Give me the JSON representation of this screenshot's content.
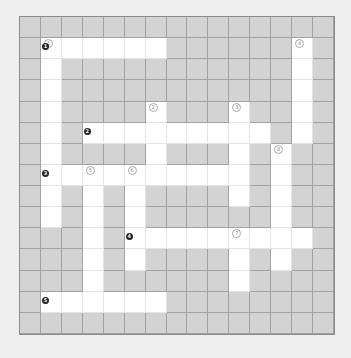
{
  "puzzle": {
    "rows": 15,
    "cols": 15,
    "colors": {
      "background": "#efefef",
      "block": "#d3d3d3",
      "open": "#ffffff",
      "grid_line": "#a2a2a2"
    },
    "white_cells": [
      [
        1,
        1
      ],
      [
        1,
        2
      ],
      [
        1,
        3
      ],
      [
        1,
        4
      ],
      [
        1,
        5
      ],
      [
        1,
        6
      ],
      [
        1,
        13
      ],
      [
        2,
        1
      ],
      [
        2,
        13
      ],
      [
        3,
        1
      ],
      [
        3,
        13
      ],
      [
        4,
        1
      ],
      [
        4,
        6
      ],
      [
        4,
        10
      ],
      [
        4,
        13
      ],
      [
        5,
        1
      ],
      [
        5,
        3
      ],
      [
        5,
        4
      ],
      [
        5,
        5
      ],
      [
        5,
        6
      ],
      [
        5,
        7
      ],
      [
        5,
        8
      ],
      [
        5,
        9
      ],
      [
        5,
        10
      ],
      [
        5,
        11
      ],
      [
        5,
        13
      ],
      [
        6,
        1
      ],
      [
        6,
        6
      ],
      [
        6,
        10
      ],
      [
        6,
        12
      ],
      [
        7,
        1
      ],
      [
        7,
        2
      ],
      [
        7,
        3
      ],
      [
        7,
        4
      ],
      [
        7,
        5
      ],
      [
        7,
        6
      ],
      [
        7,
        7
      ],
      [
        7,
        8
      ],
      [
        7,
        9
      ],
      [
        7,
        10
      ],
      [
        7,
        12
      ],
      [
        8,
        1
      ],
      [
        8,
        3
      ],
      [
        8,
        5
      ],
      [
        8,
        10
      ],
      [
        8,
        12
      ],
      [
        9,
        1
      ],
      [
        9,
        3
      ],
      [
        9,
        5
      ],
      [
        9,
        12
      ],
      [
        10,
        3
      ],
      [
        10,
        5
      ],
      [
        10,
        6
      ],
      [
        10,
        7
      ],
      [
        10,
        8
      ],
      [
        10,
        9
      ],
      [
        10,
        10
      ],
      [
        10,
        11
      ],
      [
        10,
        12
      ],
      [
        10,
        13
      ],
      [
        11,
        3
      ],
      [
        11,
        5
      ],
      [
        11,
        10
      ],
      [
        11,
        12
      ],
      [
        12,
        3
      ],
      [
        12,
        10
      ],
      [
        13,
        1
      ],
      [
        13,
        2
      ],
      [
        13,
        3
      ],
      [
        13,
        4
      ],
      [
        13,
        5
      ],
      [
        13,
        6
      ]
    ],
    "down_clues": [
      {
        "label": "1",
        "row": 1,
        "col": 1
      },
      {
        "label": "2",
        "row": 4,
        "col": 6
      },
      {
        "label": "3",
        "row": 4,
        "col": 10
      },
      {
        "label": "4",
        "row": 1,
        "col": 13
      },
      {
        "label": "5",
        "row": 7,
        "col": 3
      },
      {
        "label": "6",
        "row": 7,
        "col": 5
      },
      {
        "label": "7",
        "row": 10,
        "col": 10
      },
      {
        "label": "8",
        "row": 6,
        "col": 12
      }
    ],
    "across_clues": [
      {
        "label": "1",
        "row": 1,
        "col": 1
      },
      {
        "label": "2",
        "row": 5,
        "col": 3
      },
      {
        "label": "3",
        "row": 7,
        "col": 1
      },
      {
        "label": "4",
        "row": 10,
        "col": 5
      },
      {
        "label": "5",
        "row": 13,
        "col": 1
      }
    ]
  }
}
